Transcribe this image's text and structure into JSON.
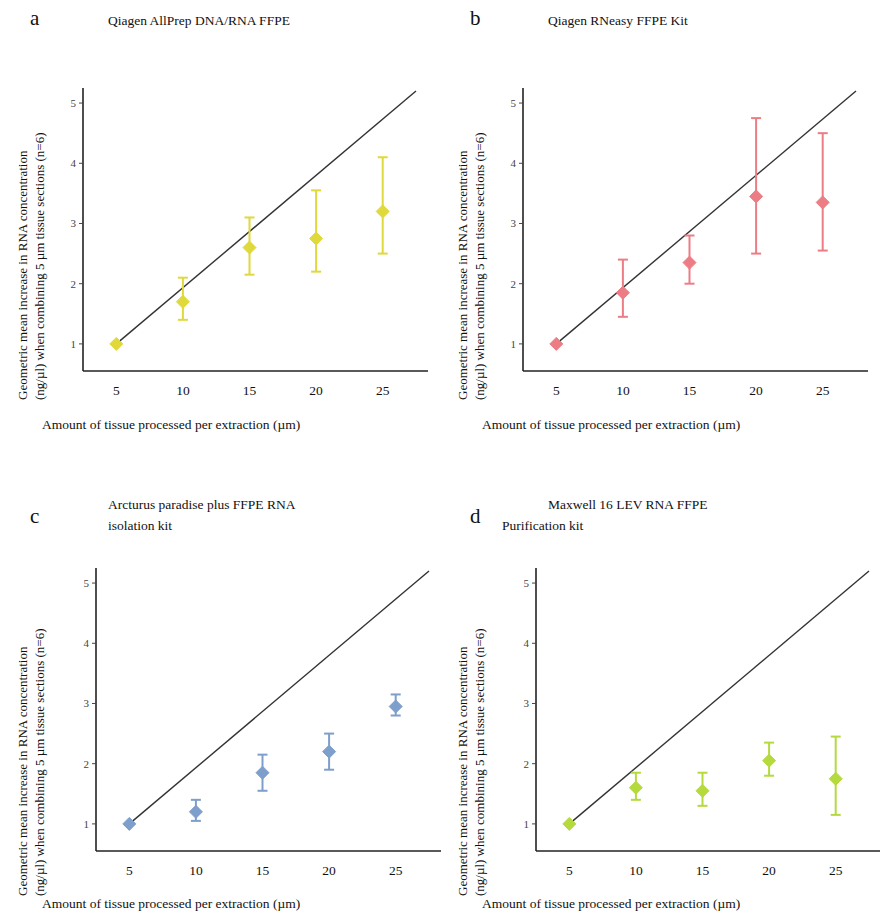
{
  "figure": {
    "axis_labels": {
      "y_line1": "Geometric mean increase in RNA concentration",
      "y_line2": "(ng/µl) when combining 5 µm tissue sections (n=6)",
      "x": "Amount of tissue processed per extraction (µm)"
    },
    "x_ticks": [
      "5",
      "10",
      "15",
      "20",
      "25"
    ],
    "y_ticks": [
      "1",
      "2",
      "3",
      "4",
      "5"
    ]
  },
  "panels": [
    {
      "letter": "a",
      "title_line1": "Qiagen AllPrep DNA/RNA FFPE",
      "title_line2": "",
      "color": "#dfd93c"
    },
    {
      "letter": "b",
      "title_line1": "Qiagen RNeasy FFPE Kit",
      "title_line2": "",
      "color": "#ec7d85"
    },
    {
      "letter": "c",
      "title_line1": "Arcturus paradise plus FFPE RNA",
      "title_line2": "isolation kit",
      "color": "#7e9ecb"
    },
    {
      "letter": "d",
      "title_line1": "Maxwell 16 LEV RNA FFPE",
      "title_line2": "Purification kit",
      "color": "#b4da3e"
    }
  ],
  "chart_data": [
    {
      "type": "scatter",
      "panel": "a",
      "title": "Qiagen AllPrep DNA/RNA FFPE",
      "xlabel": "Amount of tissue processed per extraction (µm)",
      "ylabel": "Geometric mean increase in RNA concentration (ng/µl) when combining 5 µm tissue sections (n=6)",
      "xlim": [
        2.5,
        27.5
      ],
      "ylim": [
        0.55,
        5.25
      ],
      "xticks": [
        5,
        10,
        15,
        20,
        25
      ],
      "yticks": [
        1,
        2,
        3,
        4,
        5
      ],
      "grid": false,
      "legend": "none",
      "marker": "diamond",
      "color": "#dfd93c",
      "reference_line": {
        "label": "line of identity",
        "from": [
          5,
          1
        ],
        "to": [
          27.5,
          5.2
        ],
        "color": "#333333"
      },
      "x": [
        5,
        10,
        15,
        20,
        25
      ],
      "values": [
        1.0,
        1.7,
        2.6,
        2.75,
        3.2
      ],
      "error_low": [
        1.0,
        1.4,
        2.15,
        2.2,
        2.5
      ],
      "error_high": [
        1.0,
        2.1,
        3.1,
        3.55,
        4.1
      ]
    },
    {
      "type": "scatter",
      "panel": "b",
      "title": "Qiagen RNeasy FFPE Kit",
      "xlabel": "Amount of tissue processed per extraction (µm)",
      "ylabel": "Geometric mean increase in RNA concentration (ng/µl) when combining 5 µm tissue sections (n=6)",
      "xlim": [
        2.5,
        27.5
      ],
      "ylim": [
        0.55,
        5.25
      ],
      "xticks": [
        5,
        10,
        15,
        20,
        25
      ],
      "yticks": [
        1,
        2,
        3,
        4,
        5
      ],
      "grid": false,
      "legend": "none",
      "marker": "diamond",
      "color": "#ec7d85",
      "reference_line": {
        "label": "line of identity",
        "from": [
          5,
          1
        ],
        "to": [
          27.5,
          5.2
        ],
        "color": "#333333"
      },
      "x": [
        5,
        10,
        15,
        20,
        25
      ],
      "values": [
        1.0,
        1.85,
        2.35,
        3.45,
        3.35
      ],
      "error_low": [
        1.0,
        1.45,
        2.0,
        2.5,
        2.55
      ],
      "error_high": [
        1.0,
        2.4,
        2.8,
        4.75,
        4.5
      ]
    },
    {
      "type": "scatter",
      "panel": "c",
      "title": "Arcturus paradise plus FFPE RNA isolation kit",
      "xlabel": "Amount of tissue processed per extraction (µm)",
      "ylabel": "Geometric mean increase in RNA concentration (ng/µl) when combining 5 µm tissue sections (n=6)",
      "xlim": [
        2.5,
        27.5
      ],
      "ylim": [
        0.55,
        5.25
      ],
      "xticks": [
        5,
        10,
        15,
        20,
        25
      ],
      "yticks": [
        1,
        2,
        3,
        4,
        5
      ],
      "grid": false,
      "legend": "none",
      "marker": "diamond",
      "color": "#7e9ecb",
      "reference_line": {
        "label": "line of identity",
        "from": [
          5,
          1
        ],
        "to": [
          27.5,
          5.2
        ],
        "color": "#333333"
      },
      "x": [
        5,
        10,
        15,
        20,
        25
      ],
      "values": [
        1.0,
        1.2,
        1.85,
        2.2,
        2.95
      ],
      "error_low": [
        1.0,
        1.05,
        1.55,
        1.9,
        2.8
      ],
      "error_high": [
        1.0,
        1.4,
        2.15,
        2.5,
        3.15
      ]
    },
    {
      "type": "scatter",
      "panel": "d",
      "title": "Maxwell 16 LEV RNA FFPE Purification kit",
      "xlabel": "Amount of tissue processed per extraction (µm)",
      "ylabel": "Geometric mean increase in RNA concentration (ng/µl) when combining 5 µm tissue sections (n=6)",
      "xlim": [
        2.5,
        27.5
      ],
      "ylim": [
        0.55,
        5.25
      ],
      "xticks": [
        5,
        10,
        15,
        20,
        25
      ],
      "yticks": [
        1,
        2,
        3,
        4,
        5
      ],
      "grid": false,
      "legend": "none",
      "marker": "diamond",
      "color": "#b4da3e",
      "reference_line": {
        "label": "line of identity",
        "from": [
          5,
          1
        ],
        "to": [
          27.5,
          5.2
        ],
        "color": "#333333"
      },
      "x": [
        5,
        10,
        15,
        20,
        25
      ],
      "values": [
        1.0,
        1.6,
        1.55,
        2.05,
        1.75
      ],
      "error_low": [
        1.0,
        1.4,
        1.3,
        1.8,
        1.15
      ],
      "error_high": [
        1.0,
        1.85,
        1.85,
        2.35,
        2.45
      ]
    }
  ]
}
